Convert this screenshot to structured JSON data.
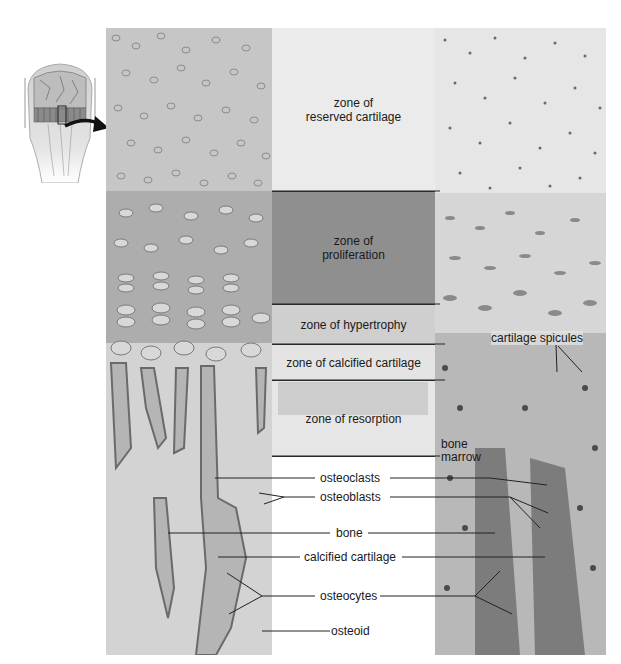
{
  "figure": {
    "inset": {
      "label": "bone-inset-illustration"
    },
    "zones": [
      {
        "id": "reserved",
        "line1": "zone of",
        "line2": "reserved cartilage"
      },
      {
        "id": "proliferation",
        "line1": "zone of",
        "line2": "proliferation"
      },
      {
        "id": "hypertrophy",
        "line1": "zone of hypertrophy",
        "line2": ""
      },
      {
        "id": "calcified",
        "line1": "zone of calcified cartilage",
        "line2": ""
      },
      {
        "id": "resorption",
        "line1": "zone of resorption",
        "line2": ""
      }
    ],
    "right_labels": {
      "cartilage_spicules": "cartilage spicules",
      "bone_marrow_1": "bone",
      "bone_marrow_2": "marrow"
    },
    "center_labels": {
      "osteoclasts": "osteoclasts",
      "osteoblasts": "osteoblasts",
      "bone": "bone",
      "calcified_cartilage": "calcified cartilage",
      "osteocytes": "osteocytes",
      "osteoid": "osteoid"
    },
    "colors": {
      "reserved_band": "#ebebeb",
      "proliferation_band": "#8f8f8f",
      "hypertrophy_band": "#cfcfcf",
      "calcified_band": "#e4e4e4",
      "resorption_band": "#e6e6e6",
      "leader_line": "#222222"
    }
  }
}
